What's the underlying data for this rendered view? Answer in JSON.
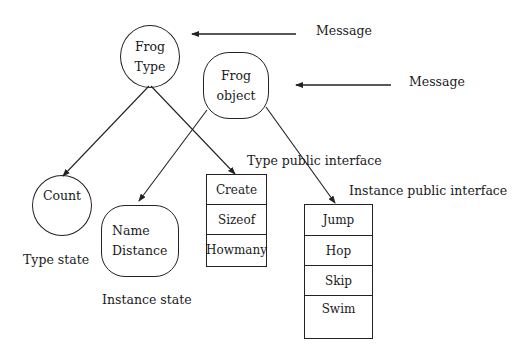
{
  "diagram": {
    "nodes": {
      "frog_type": [
        "Frog",
        "Type"
      ],
      "frog_object": [
        "Frog",
        "object"
      ],
      "count": "Count",
      "instance_state_vars": [
        "Name",
        "Distance"
      ]
    },
    "messages": [
      "Message",
      "Message"
    ],
    "labels": {
      "type_state": "Type state",
      "instance_state": "Instance state",
      "type_public_interface": "Type public interface",
      "instance_public_interface": "Instance public interface"
    },
    "type_interface_methods": [
      "Create",
      "Sizeof",
      "Howmany"
    ],
    "instance_interface_methods": [
      "Jump",
      "Hop",
      "Skip",
      "Swim"
    ],
    "colors": {
      "stroke": "#222222",
      "background": "#ffffff"
    }
  }
}
